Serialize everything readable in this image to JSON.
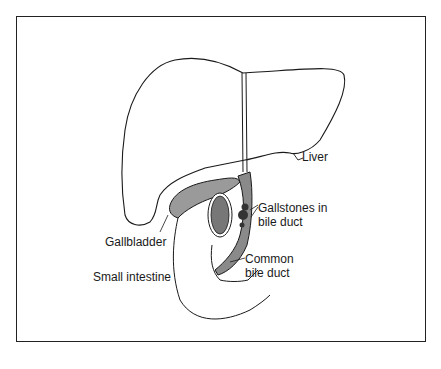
{
  "diagram": {
    "type": "anatomical illustration",
    "colors": {
      "outline": "#1a1a1a",
      "fill_shaded": "#9a9a9a",
      "fill_dark": "#4a4a4a",
      "background": "#ffffff"
    },
    "labels": {
      "liver": "Liver",
      "gallstones_line1": "Gallstones in",
      "gallstones_line2": "bile duct",
      "gallbladder": "Gallbladder",
      "common_duct_line1": "Common",
      "common_duct_line2": "bile duct",
      "small_intestine": "Small intestine"
    }
  }
}
